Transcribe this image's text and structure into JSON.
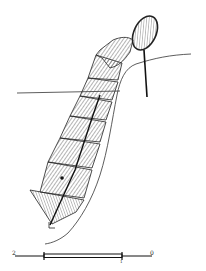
{
  "figure": {
    "colors": {
      "ink": "#1a1a1a",
      "hatch": "#555555",
      "background": "#ffffff"
    }
  },
  "scale_bar": {
    "labels": [
      "2",
      "1",
      "0"
    ]
  }
}
